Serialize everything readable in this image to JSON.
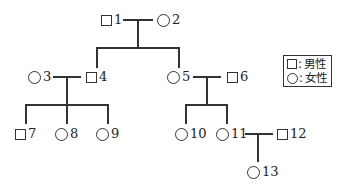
{
  "diagram": {
    "type": "pedigree",
    "individuals": [
      {
        "id": "1",
        "label": "1",
        "sex": "male"
      },
      {
        "id": "2",
        "label": "2",
        "sex": "female"
      },
      {
        "id": "3",
        "label": "3",
        "sex": "female"
      },
      {
        "id": "4",
        "label": "4",
        "sex": "male"
      },
      {
        "id": "5",
        "label": "5",
        "sex": "female"
      },
      {
        "id": "6",
        "label": "6",
        "sex": "male"
      },
      {
        "id": "7",
        "label": "7",
        "sex": "male"
      },
      {
        "id": "8",
        "label": "8",
        "sex": "female"
      },
      {
        "id": "9",
        "label": "9",
        "sex": "female"
      },
      {
        "id": "10",
        "label": "10",
        "sex": "female"
      },
      {
        "id": "11",
        "label": "11",
        "sex": "female"
      },
      {
        "id": "12",
        "label": "12",
        "sex": "male"
      },
      {
        "id": "13",
        "label": "13",
        "sex": "female"
      }
    ],
    "couples": [
      {
        "partners": [
          "1",
          "2"
        ],
        "children": [
          "4",
          "5"
        ]
      },
      {
        "partners": [
          "3",
          "4"
        ],
        "children": [
          "7",
          "8",
          "9"
        ]
      },
      {
        "partners": [
          "5",
          "6"
        ],
        "children": [
          "10",
          "11"
        ]
      },
      {
        "partners": [
          "11",
          "12"
        ],
        "children": [
          "13"
        ]
      }
    ]
  },
  "legend": {
    "male": {
      "symbol": "□",
      "label": "男性"
    },
    "female": {
      "symbol": "○",
      "label": "女性"
    },
    "separator": ":"
  },
  "colors": {
    "line": "#333333",
    "background": "#ffffff"
  }
}
